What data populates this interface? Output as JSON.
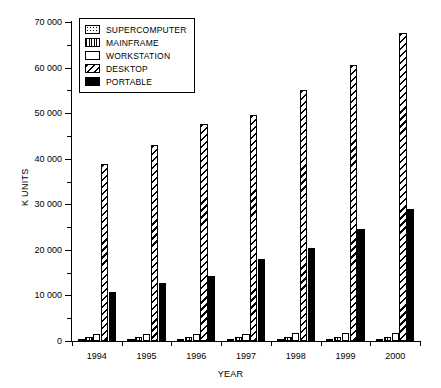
{
  "chart_data": {
    "type": "bar",
    "title": "",
    "xlabel": "YEAR",
    "ylabel": "K UNITS",
    "categories": [
      "1994",
      "1995",
      "1996",
      "1997",
      "1998",
      "1999",
      "2000"
    ],
    "ylim": [
      0,
      70000
    ],
    "yticks": [
      0,
      10000,
      20000,
      30000,
      40000,
      50000,
      60000,
      70000
    ],
    "ytick_labels": [
      "0",
      "10 000",
      "20 000",
      "30 000",
      "40 000",
      "50 000",
      "60 000",
      "70 000"
    ],
    "grid": false,
    "legend_position": "top-left",
    "series": [
      {
        "name": "SUPERCOMPUTER",
        "pattern": "dots",
        "values": [
          400,
          420,
          450,
          470,
          500,
          520,
          550
        ]
      },
      {
        "name": "MAINFRAME",
        "pattern": "vertical-lines",
        "values": [
          900,
          900,
          900,
          900,
          900,
          900,
          900
        ]
      },
      {
        "name": "WORKSTATION",
        "pattern": "white",
        "values": [
          1500,
          1500,
          1600,
          1600,
          1700,
          1700,
          1800
        ]
      },
      {
        "name": "DESKTOP",
        "pattern": "diagonal-hatch",
        "values": [
          38800,
          43000,
          47700,
          49500,
          55000,
          60500,
          67500
        ]
      },
      {
        "name": "PORTABLE",
        "pattern": "solid-black",
        "values": [
          10700,
          12700,
          14300,
          18000,
          20500,
          24500,
          29000
        ]
      }
    ]
  },
  "legend": {
    "items": [
      {
        "label": "SUPERCOMPUTER"
      },
      {
        "label": "MAINFRAME"
      },
      {
        "label": "WORKSTATION"
      },
      {
        "label": "DESKTOP"
      },
      {
        "label": "PORTABLE"
      }
    ]
  },
  "axes": {
    "y_title": "K UNITS",
    "x_title": "YEAR"
  }
}
